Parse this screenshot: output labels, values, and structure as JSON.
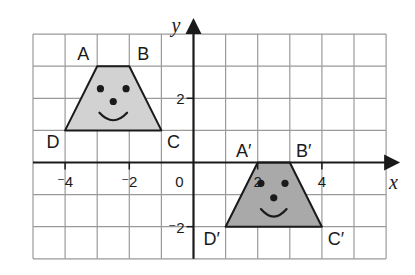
{
  "diagram": {
    "type": "coordinate-grid-transformation",
    "axes": {
      "x_label": "x",
      "y_label": "y",
      "x_range": [
        -5,
        6
      ],
      "y_range": [
        -3,
        4
      ],
      "origin_label": "0",
      "x_tick_labels": [
        {
          "value": -4,
          "label": "⁻4"
        },
        {
          "value": -2,
          "label": "⁻2"
        },
        {
          "value": 2,
          "label": "2"
        },
        {
          "value": 4,
          "label": "4"
        }
      ],
      "y_tick_labels": [
        {
          "value": 2,
          "label": "2"
        },
        {
          "value": -2,
          "label": "⁻2"
        }
      ]
    },
    "shapes": [
      {
        "name": "original-trapezoid",
        "fill": "#d2d2d2",
        "vertices": [
          {
            "label": "A",
            "x": -3,
            "y": 3
          },
          {
            "label": "B",
            "x": -2,
            "y": 3
          },
          {
            "label": "C",
            "x": -1,
            "y": 1
          },
          {
            "label": "D",
            "x": -4,
            "y": 1
          }
        ],
        "face": {
          "eyes": [
            [
              -2.9,
              2.3
            ],
            [
              -2.1,
              2.3
            ]
          ],
          "nose": [
            -2.5,
            1.9
          ],
          "smile": {
            "cx": -2.5,
            "cy": 1.55,
            "halfwidth": 0.43
          }
        }
      },
      {
        "name": "image-trapezoid",
        "fill": "#a9a9a9",
        "vertices": [
          {
            "label": "A′",
            "x": 2,
            "y": 0
          },
          {
            "label": "B′",
            "x": 3,
            "y": 0
          },
          {
            "label": "C′",
            "x": 4,
            "y": -2
          },
          {
            "label": "D′",
            "x": 1,
            "y": -2
          }
        ],
        "face": {
          "eyes": [
            [
              2.1,
              -0.65
            ],
            [
              2.85,
              -0.65
            ]
          ],
          "nose": [
            2.5,
            -1.1
          ],
          "smile": {
            "cx": 2.5,
            "cy": -1.45,
            "halfwidth": 0.4
          }
        }
      }
    ],
    "colors": {
      "grid": "#9a9a9a",
      "axis": "#1a1a1a",
      "outline": "#1a1a1a"
    }
  }
}
